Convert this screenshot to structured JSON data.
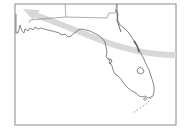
{
  "map": {
    "region": "Florida",
    "colors": {
      "background": "#ffffff",
      "frame": "#8a8a8a",
      "coastline": "#555555",
      "state_border": "#777777",
      "track_arrow": "#d4d4d4"
    },
    "features": {
      "frame": "map-frame",
      "coastline": "florida-coastline",
      "state_borders": "georgia-alabama-border",
      "lake": "lake-okeechobee",
      "keys": "florida-keys",
      "track": "storm-track-arrow"
    }
  }
}
